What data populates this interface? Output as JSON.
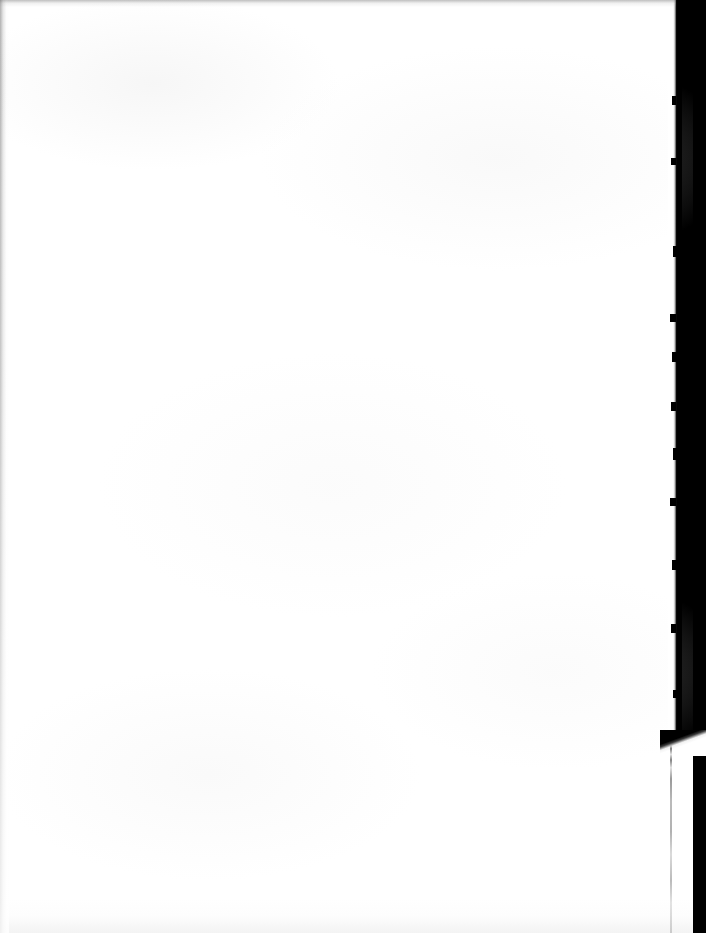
{
  "document": {
    "kind": "scanned-blank-page",
    "page_background_color": "#ffffff",
    "scanner_background_color": "#000000",
    "edge_shadow_color": "#787878",
    "fold_line_color": "#6e6e6e",
    "width_px": 706,
    "height_px": 933
  },
  "visible_text": {
    "body_text": "",
    "page_number": "",
    "header": "",
    "footer": ""
  },
  "show_through": {
    "note": "illegible bleed-through ghost text from reverse side",
    "lines": [
      "",
      "",
      ""
    ]
  },
  "regions": {
    "paper_upper_label": "",
    "paper_lower_label": "",
    "scanner_band_label": "",
    "fold_line_label": ""
  }
}
